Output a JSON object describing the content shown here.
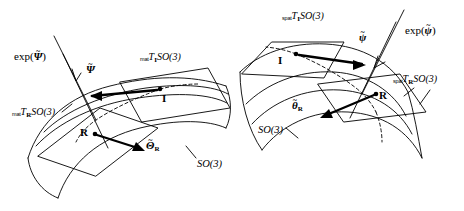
{
  "figure": {
    "background": "#ffffff",
    "stroke": "#000000",
    "panels": [
      {
        "id": "left-panel",
        "variant": "material",
        "manifold_label": "SO(3)",
        "exp_label_prefix": "exp(",
        "exp_label_arg": "Ψ",
        "exp_label_suffix": ")",
        "exp_tilde": "~",
        "tangent_plane_I": {
          "prefix": "mat",
          "symbol": "T",
          "subscript": "I",
          "group": "SO(3)"
        },
        "tangent_plane_R": {
          "prefix": "mat",
          "symbol": "T",
          "subscript": "R",
          "group": "SO(3)"
        },
        "point_identity": "I",
        "point_rotation": "R",
        "vector_upper": {
          "symbol": "Ψ",
          "tilde": "~",
          "subscript": ""
        },
        "vector_lower": {
          "symbol": "Θ",
          "tilde": "~",
          "subscript": "R"
        }
      },
      {
        "id": "right-panel",
        "variant": "spatial",
        "manifold_label": "SO(3)",
        "exp_label_prefix": "exp(",
        "exp_label_arg": "ψ",
        "exp_label_suffix": ")",
        "exp_tilde": "~",
        "tangent_plane_I": {
          "prefix": "spat",
          "symbol": "T",
          "subscript": "I",
          "group": "SO(3)"
        },
        "tangent_plane_R": {
          "prefix": "spat",
          "symbol": "T",
          "subscript": "R",
          "group": "SO(3)"
        },
        "point_identity": "I",
        "point_rotation": "R",
        "vector_upper": {
          "symbol": "ψ",
          "tilde": "~",
          "subscript": ""
        },
        "vector_lower": {
          "symbol": "θ",
          "tilde": "~",
          "subscript": "R"
        }
      }
    ]
  }
}
